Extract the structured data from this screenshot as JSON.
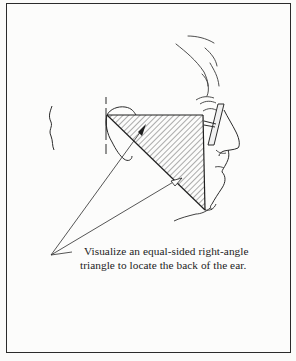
{
  "figure": {
    "caption_line1": "Visualize an equal-sided right-angle",
    "caption_line2": "triangle to locate the back of the ear.",
    "colors": {
      "ink": "#2b2b2b",
      "paper": "#fcfcfb",
      "hatch": "#4a4a4a"
    },
    "elements": [
      "head-profile-sketch",
      "ear-outline",
      "eyeglasses",
      "right-angle-triangle-hatched",
      "pointer-lines",
      "back-of-head-curve",
      "vertical-guide-line"
    ]
  }
}
